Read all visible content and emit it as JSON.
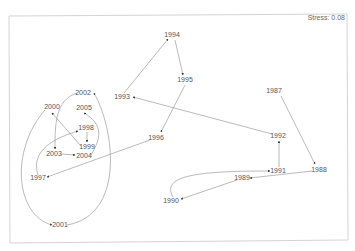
{
  "diagram": {
    "type": "trajectory-mds-plot",
    "stress_label": "Stress: 0.08",
    "colors": {
      "edge": "#8c8c8c",
      "label": "#555555",
      "frame": "#d4d4d4"
    },
    "nodes": [
      {
        "id": "1987",
        "label": "1987",
        "x": 274,
        "y": 93
      },
      {
        "id": "1988",
        "label": "1988",
        "x": 319,
        "y": 172
      },
      {
        "id": "1989",
        "label": "1989",
        "x": 242,
        "y": 180
      },
      {
        "id": "1990",
        "label": "1990",
        "x": 171,
        "y": 203
      },
      {
        "id": "1991",
        "label": "1991",
        "x": 278,
        "y": 173
      },
      {
        "id": "1992",
        "label": "1992",
        "x": 278,
        "y": 138
      },
      {
        "id": "1993",
        "label": "1993",
        "x": 122,
        "y": 99
      },
      {
        "id": "1994",
        "label": "1994",
        "x": 172,
        "y": 37
      },
      {
        "id": "1995",
        "label": "1995",
        "x": 185,
        "y": 82
      },
      {
        "id": "1996",
        "label": "1996",
        "x": 156,
        "y": 140
      },
      {
        "id": "1997",
        "label": "1997",
        "x": 38,
        "y": 180
      },
      {
        "id": "1998",
        "label": "1998",
        "x": 86,
        "y": 130
      },
      {
        "id": "1999",
        "label": "1999",
        "x": 87,
        "y": 149
      },
      {
        "id": "2000",
        "label": "2000",
        "x": 52,
        "y": 109
      },
      {
        "id": "2001",
        "label": "2001",
        "x": 60,
        "y": 227
      },
      {
        "id": "2002",
        "label": "2002",
        "x": 83,
        "y": 95
      },
      {
        "id": "2003",
        "label": "2003",
        "x": 54,
        "y": 156
      },
      {
        "id": "2004",
        "label": "2004",
        "x": 84,
        "y": 158
      },
      {
        "id": "2005",
        "label": "2005",
        "x": 84,
        "y": 110
      }
    ],
    "edges": [
      {
        "from": "1987",
        "to": "1988"
      },
      {
        "from": "1988",
        "to": "1989"
      },
      {
        "from": "1989",
        "to": "1990"
      },
      {
        "from": "1990",
        "to": "1991"
      },
      {
        "from": "1991",
        "to": "1992"
      },
      {
        "from": "1992",
        "to": "1993"
      },
      {
        "from": "1993",
        "to": "1994"
      },
      {
        "from": "1994",
        "to": "1995"
      },
      {
        "from": "1995",
        "to": "1996"
      },
      {
        "from": "1996",
        "to": "1997"
      },
      {
        "from": "1997",
        "to": "1998"
      },
      {
        "from": "1998",
        "to": "1999"
      },
      {
        "from": "1999",
        "to": "2000"
      },
      {
        "from": "2000",
        "to": "2001"
      },
      {
        "from": "2001",
        "to": "2002"
      },
      {
        "from": "2002",
        "to": "2003"
      },
      {
        "from": "2003",
        "to": "2004"
      },
      {
        "from": "2004",
        "to": "2005"
      }
    ]
  }
}
